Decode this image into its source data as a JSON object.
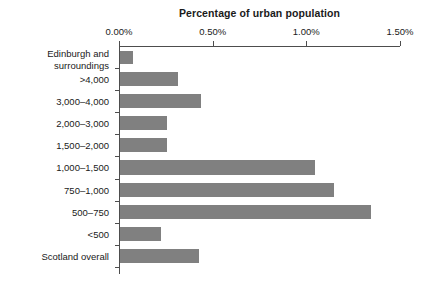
{
  "chart_data": {
    "type": "bar",
    "orientation": "horizontal",
    "title": "Percentage of urban population",
    "xlabel": "Percentage of urban population",
    "ylabel": "Size of town in 1639",
    "categories": [
      "Edinburgh and\nsurroundings",
      ">4,000",
      "3,000–4,000",
      "2,000–3,000",
      "1,500–2,000",
      "1,000–1,500",
      "750–1,000",
      "500–750",
      "<500",
      "Scotland overall"
    ],
    "values": [
      0.07,
      0.31,
      0.43,
      0.25,
      0.25,
      1.04,
      1.14,
      1.34,
      0.22,
      0.42
    ],
    "xlim": [
      0.0,
      1.5
    ],
    "xticks": [
      0.0,
      0.5,
      1.0,
      1.5
    ],
    "xtick_labels": [
      "0.00%",
      "0.50%",
      "1.00%",
      "1.50%"
    ],
    "grid": false,
    "legend": null,
    "bar_color": "#808080",
    "axis_color": "#4d4d4d",
    "background": "#ffffff"
  }
}
